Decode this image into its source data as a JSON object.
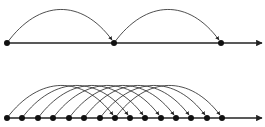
{
  "diagram": {
    "colors": {
      "stroke": "#222222",
      "dot": "#111111",
      "background": "#ffffff"
    },
    "top": {
      "axis_y": 43,
      "axis_start_x": 7,
      "axis_end_x": 262,
      "points_x": [
        7,
        114,
        221
      ],
      "jumps": [
        [
          0,
          1
        ],
        [
          1,
          2
        ]
      ],
      "arc_height": 34
    },
    "bottom": {
      "axis_y": 118,
      "axis_start_x": 7,
      "axis_end_x": 262,
      "points_x": [
        7,
        22,
        38,
        53,
        69,
        84,
        100,
        115,
        130,
        145,
        161,
        176,
        191,
        207,
        222
      ],
      "jump_span": 7,
      "arc_height": 33
    }
  }
}
